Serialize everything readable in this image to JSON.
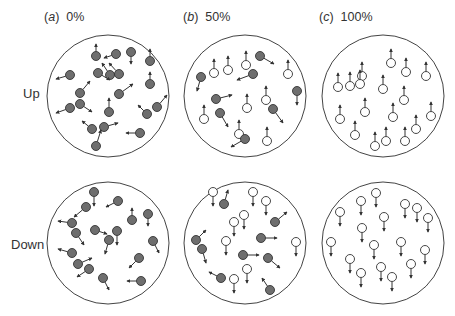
{
  "panels": [
    {
      "id": "a",
      "letter": "a",
      "percent": "0%"
    },
    {
      "id": "b",
      "letter": "b",
      "percent": "50%"
    },
    {
      "id": "c",
      "letter": "c",
      "percent": "100%"
    }
  ],
  "rows": [
    {
      "label": "Up"
    },
    {
      "label": "Down"
    }
  ],
  "colors": {
    "filled": "#6e6e6e",
    "open": "#ffffff",
    "stroke": "#333333",
    "circle": "#444444"
  },
  "particles": {
    "up_a": [
      [
        96,
        56,
        0,
        -12
      ],
      [
        116,
        54,
        -12,
        4
      ],
      [
        131,
        52,
        0,
        12
      ],
      [
        150,
        61,
        0,
        -12
      ],
      [
        110,
        75,
        -8,
        -12
      ],
      [
        70,
        75,
        -14,
        4
      ],
      [
        98,
        73,
        12,
        7
      ],
      [
        119,
        74,
        -10,
        -11
      ],
      [
        80,
        93,
        10,
        -12
      ],
      [
        119,
        94,
        14,
        -10
      ],
      [
        150,
        84,
        0,
        -12
      ],
      [
        70,
        108,
        -14,
        5
      ],
      [
        80,
        104,
        12,
        8
      ],
      [
        109,
        112,
        0,
        -14
      ],
      [
        157,
        107,
        10,
        -12
      ],
      [
        147,
        114,
        -9,
        -9
      ],
      [
        92,
        129,
        -10,
        -8
      ],
      [
        104,
        127,
        14,
        -4
      ],
      [
        96,
        146,
        5,
        -16
      ],
      [
        140,
        133,
        -14,
        0
      ]
    ],
    "up_b": [
      [
        214,
        73,
        0,
        -14
      ],
      [
        228,
        70,
        0,
        -14
      ],
      [
        246,
        65,
        0,
        -14
      ],
      [
        260,
        56,
        14,
        8
      ],
      [
        288,
        74,
        0,
        -14
      ],
      [
        201,
        77,
        -4,
        14
      ],
      [
        253,
        74,
        -16,
        6
      ],
      [
        297,
        91,
        0,
        14
      ],
      [
        216,
        99,
        16,
        -4
      ],
      [
        247,
        108,
        0,
        -14
      ],
      [
        266,
        100,
        0,
        -14
      ],
      [
        204,
        119,
        0,
        -14
      ],
      [
        220,
        113,
        8,
        14
      ],
      [
        273,
        109,
        10,
        14
      ],
      [
        239,
        134,
        0,
        -14
      ],
      [
        245,
        139,
        -14,
        8
      ],
      [
        267,
        141,
        0,
        -14
      ]
    ],
    "up_c": [
      [
        391,
        63,
        0,
        -14
      ],
      [
        350,
        86,
        0,
        -14
      ],
      [
        362,
        76,
        0,
        -14
      ],
      [
        406,
        72,
        0,
        -14
      ],
      [
        426,
        76,
        0,
        -14
      ],
      [
        338,
        87,
        0,
        -14
      ],
      [
        360,
        84,
        0,
        -14
      ],
      [
        383,
        89,
        0,
        -14
      ],
      [
        404,
        100,
        0,
        -14
      ],
      [
        340,
        119,
        0,
        -14
      ],
      [
        365,
        112,
        0,
        -14
      ],
      [
        393,
        117,
        0,
        -14
      ],
      [
        431,
        116,
        0,
        -14
      ],
      [
        355,
        135,
        0,
        -14
      ],
      [
        386,
        141,
        0,
        -14
      ],
      [
        416,
        129,
        0,
        -14
      ],
      [
        375,
        146,
        0,
        -14
      ],
      [
        405,
        141,
        0,
        -14
      ]
    ],
    "down_a": [
      [
        94,
        192,
        0,
        14
      ],
      [
        86,
        207,
        -12,
        10
      ],
      [
        118,
        201,
        -12,
        6
      ],
      [
        132,
        220,
        0,
        -12
      ],
      [
        148,
        214,
        0,
        12
      ],
      [
        72,
        223,
        -14,
        -2
      ],
      [
        76,
        233,
        8,
        12
      ],
      [
        95,
        230,
        12,
        4
      ],
      [
        117,
        231,
        0,
        14
      ],
      [
        109,
        240,
        -4,
        14
      ],
      [
        153,
        241,
        6,
        12
      ],
      [
        72,
        253,
        -14,
        -4
      ],
      [
        78,
        264,
        14,
        -6
      ],
      [
        89,
        269,
        -12,
        8
      ],
      [
        139,
        258,
        -10,
        10
      ],
      [
        103,
        278,
        6,
        12
      ],
      [
        141,
        281,
        -14,
        0
      ]
    ],
    "down_b": [
      [
        213,
        192,
        0,
        14
      ],
      [
        224,
        204,
        4,
        -14
      ],
      [
        253,
        192,
        0,
        14
      ],
      [
        266,
        201,
        0,
        14
      ],
      [
        275,
        222,
        12,
        -10
      ],
      [
        234,
        222,
        0,
        14
      ],
      [
        244,
        215,
        0,
        14
      ],
      [
        196,
        240,
        10,
        -10
      ],
      [
        202,
        249,
        4,
        14
      ],
      [
        226,
        241,
        0,
        14
      ],
      [
        261,
        238,
        16,
        0
      ],
      [
        296,
        242,
        0,
        14
      ],
      [
        243,
        255,
        16,
        0
      ],
      [
        268,
        258,
        12,
        10
      ],
      [
        221,
        278,
        -12,
        -6
      ],
      [
        234,
        279,
        0,
        14
      ],
      [
        247,
        269,
        0,
        14
      ],
      [
        270,
        290,
        -8,
        -12
      ]
    ],
    "down_c": [
      [
        376,
        193,
        0,
        14
      ],
      [
        361,
        201,
        0,
        14
      ],
      [
        340,
        212,
        0,
        14
      ],
      [
        384,
        217,
        0,
        14
      ],
      [
        405,
        204,
        0,
        14
      ],
      [
        417,
        208,
        0,
        14
      ],
      [
        428,
        218,
        0,
        14
      ],
      [
        362,
        228,
        0,
        14
      ],
      [
        331,
        242,
        0,
        14
      ],
      [
        374,
        245,
        0,
        14
      ],
      [
        401,
        242,
        0,
        14
      ],
      [
        425,
        250,
        0,
        14
      ],
      [
        350,
        259,
        0,
        14
      ],
      [
        381,
        267,
        0,
        14
      ],
      [
        411,
        264,
        0,
        14
      ],
      [
        361,
        273,
        0,
        14
      ],
      [
        392,
        277,
        0,
        14
      ]
    ]
  }
}
